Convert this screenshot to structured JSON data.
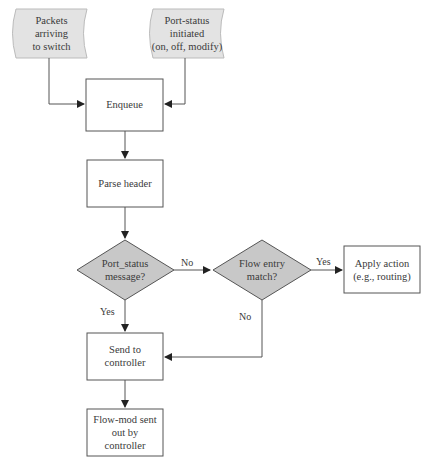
{
  "diagram": {
    "nodes": {
      "packets_in": {
        "label_lines": [
          "Packets",
          "arriving",
          "to switch"
        ],
        "shape": "curved-document",
        "fill": "#e3e3e3"
      },
      "port_status_init": {
        "label_lines": [
          "Port-status",
          "initiated",
          "(on, off, modify)"
        ],
        "shape": "curved-document",
        "fill": "#e3e3e3"
      },
      "enqueue": {
        "label": "Enqueue",
        "shape": "rectangle"
      },
      "parse_header": {
        "label": "Parse header",
        "shape": "rectangle"
      },
      "port_status_msg": {
        "label_lines": [
          "Port_status",
          "message?"
        ],
        "shape": "diamond",
        "fill": "#c8c8c8"
      },
      "flow_entry_match": {
        "label_lines": [
          "Flow entry",
          "match?"
        ],
        "shape": "diamond",
        "fill": "#c8c8c8"
      },
      "apply_action": {
        "label_lines": [
          "Apply action",
          "(e.g., routing)"
        ],
        "shape": "rectangle"
      },
      "send_to_controller": {
        "label_lines": [
          "Send to",
          "controller"
        ],
        "shape": "rectangle"
      },
      "flow_mod": {
        "label_lines": [
          "Flow-mod sent",
          "out by",
          "controller"
        ],
        "shape": "rectangle"
      }
    },
    "edges": {
      "no_1": "No",
      "yes_1": "Yes",
      "yes_2": "Yes",
      "no_2": "No"
    },
    "colors": {
      "stroke": "#555555",
      "diamond_fill": "#c8c8c8",
      "input_fill": "#e3e3e3"
    }
  },
  "caption": "                    "
}
